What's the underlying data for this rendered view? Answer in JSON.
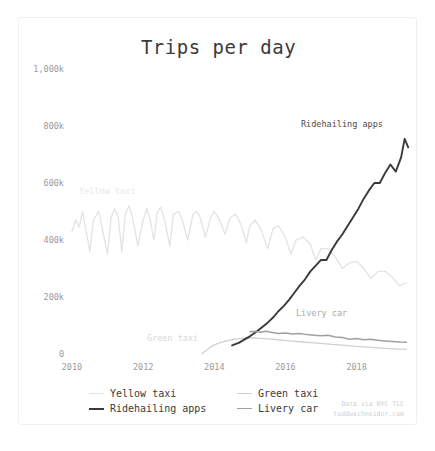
{
  "card": {
    "background": "#ffffff",
    "border_color": "#f0f0f0"
  },
  "title": "Trips per day",
  "annotations": [
    {
      "name": "yellow-taxi",
      "text": "Yellow taxi",
      "color": "#e8e8e8",
      "x": 60,
      "y": 168
    },
    {
      "name": "ridehailing-apps",
      "text": "Ridehailing apps",
      "color": "#4a4a4a",
      "x": 282,
      "y": 101
    },
    {
      "name": "livery-car",
      "text": "Livery car",
      "color": "#a8a8a8",
      "x": 277,
      "y": 290
    },
    {
      "name": "green-taxi",
      "text": "Green taxi",
      "color": "#d8d8d8",
      "x": 128,
      "y": 315
    }
  ],
  "legend": {
    "position": "bottom-left",
    "items": [
      {
        "label": "Yellow taxi",
        "color": "#e3e3e3",
        "width": 1.4
      },
      {
        "label": "Green taxi",
        "color": "#d0d0d0",
        "width": 1.4
      },
      {
        "label": "Ridehailing apps",
        "color": "#3a3a3a",
        "width": 2.6
      },
      {
        "label": "Livery car",
        "color": "#a0a0a0",
        "width": 1.6
      }
    ]
  },
  "attribution": {
    "line1": "Data via NYC TLC",
    "line2": "toddwschneider.com",
    "color": "#cfcfcf"
  },
  "chart_data": {
    "type": "line",
    "title": "Trips per day",
    "xlabel": "",
    "ylabel": "",
    "grid": false,
    "legend_position": "bottom-left",
    "xlim": [
      2010.0,
      2019.5
    ],
    "ylim": [
      0,
      1000000
    ],
    "yticks": [
      0,
      200000,
      400000,
      600000,
      800000,
      1000000
    ],
    "ytick_labels": [
      "0",
      "200k",
      "400k",
      "600k",
      "800k",
      "1,000k"
    ],
    "xticks": [
      2010,
      2012,
      2014,
      2016,
      2018
    ],
    "xtick_labels": [
      "2010",
      "2012",
      "2014",
      "2016",
      "2018"
    ],
    "units": "trips per day",
    "series": [
      {
        "name": "Yellow taxi",
        "color": "#e3e3e3",
        "width": 1.3,
        "x": [
          2010.0,
          2010.1,
          2010.2,
          2010.3,
          2010.4,
          2010.5,
          2010.6,
          2010.75,
          2010.85,
          2011.0,
          2011.1,
          2011.2,
          2011.3,
          2011.4,
          2011.5,
          2011.6,
          2011.7,
          2011.85,
          2012.0,
          2012.1,
          2012.2,
          2012.3,
          2012.4,
          2012.5,
          2012.6,
          2012.75,
          2012.85,
          2013.0,
          2013.1,
          2013.25,
          2013.4,
          2013.5,
          2013.6,
          2013.75,
          2013.9,
          2014.0,
          2014.15,
          2014.3,
          2014.45,
          2014.6,
          2014.75,
          2014.9,
          2015.0,
          2015.15,
          2015.3,
          2015.5,
          2015.65,
          2015.8,
          2016.0,
          2016.15,
          2016.3,
          2016.5,
          2016.7,
          2016.85,
          2017.0,
          2017.2,
          2017.4,
          2017.6,
          2017.8,
          2018.0,
          2018.2,
          2018.4,
          2018.6,
          2018.8,
          2019.0,
          2019.2,
          2019.4
        ],
        "y": [
          430000,
          470000,
          445000,
          500000,
          430000,
          360000,
          470000,
          500000,
          440000,
          350000,
          480000,
          510000,
          480000,
          360000,
          490000,
          520000,
          480000,
          380000,
          470000,
          510000,
          470000,
          400000,
          500000,
          515000,
          470000,
          380000,
          490000,
          500000,
          470000,
          400000,
          490000,
          500000,
          480000,
          410000,
          480000,
          500000,
          470000,
          420000,
          480000,
          490000,
          455000,
          390000,
          450000,
          470000,
          440000,
          370000,
          440000,
          450000,
          410000,
          350000,
          400000,
          410000,
          385000,
          330000,
          370000,
          370000,
          340000,
          300000,
          320000,
          325000,
          300000,
          265000,
          290000,
          290000,
          270000,
          240000,
          250000
        ]
      },
      {
        "name": "Green taxi",
        "color": "#d0d0d0",
        "width": 1.3,
        "x": [
          2013.65,
          2013.75,
          2013.85,
          2014.0,
          2014.2,
          2014.4,
          2014.6,
          2014.8,
          2015.0,
          2015.2,
          2015.4,
          2015.6,
          2015.8,
          2016.0,
          2016.2,
          2016.4,
          2016.6,
          2016.8,
          2017.0,
          2017.3,
          2017.6,
          2018.0,
          2018.4,
          2018.8,
          2019.2,
          2019.4
        ],
        "y": [
          2000,
          10000,
          20000,
          32000,
          42000,
          48000,
          52000,
          55000,
          57000,
          56000,
          54000,
          52000,
          50000,
          47000,
          45000,
          43000,
          41000,
          39000,
          37000,
          34000,
          31000,
          27000,
          23000,
          20000,
          17000,
          16000
        ]
      },
      {
        "name": "Ridehailing apps",
        "color": "#3a3a3a",
        "width": 1.9,
        "x": [
          2014.5,
          2014.7,
          2014.9,
          2015.0,
          2015.2,
          2015.35,
          2015.5,
          2015.65,
          2015.8,
          2015.95,
          2016.1,
          2016.25,
          2016.4,
          2016.55,
          2016.7,
          2016.85,
          2017.0,
          2017.15,
          2017.3,
          2017.45,
          2017.6,
          2017.75,
          2017.9,
          2018.05,
          2018.2,
          2018.35,
          2018.5,
          2018.65,
          2018.8,
          2018.95,
          2019.1,
          2019.25,
          2019.35,
          2019.45
        ],
        "y": [
          30000,
          40000,
          55000,
          62000,
          80000,
          95000,
          110000,
          128000,
          150000,
          168000,
          190000,
          215000,
          240000,
          262000,
          290000,
          310000,
          330000,
          330000,
          365000,
          395000,
          420000,
          450000,
          480000,
          510000,
          545000,
          575000,
          600000,
          600000,
          635000,
          665000,
          640000,
          690000,
          755000,
          725000
        ]
      },
      {
        "name": "Livery car",
        "color": "#a0a0a0",
        "width": 1.5,
        "x": [
          2015.0,
          2015.15,
          2015.3,
          2015.45,
          2015.6,
          2015.8,
          2016.0,
          2016.2,
          2016.4,
          2016.6,
          2016.8,
          2017.0,
          2017.2,
          2017.4,
          2017.6,
          2017.8,
          2018.0,
          2018.2,
          2018.4,
          2018.6,
          2018.8,
          2019.0,
          2019.2,
          2019.4
        ],
        "y": [
          78000,
          80000,
          76000,
          80000,
          76000,
          72000,
          74000,
          70000,
          72000,
          68000,
          66000,
          64000,
          66000,
          60000,
          58000,
          52000,
          54000,
          50000,
          52000,
          48000,
          46000,
          44000,
          42000,
          41000
        ]
      }
    ]
  }
}
